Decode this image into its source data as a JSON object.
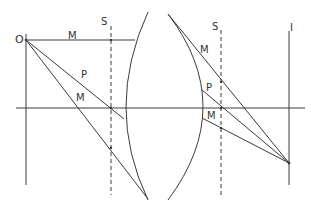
{
  "diagram": {
    "type": "optical ray diagram (thick lens, principal planes)",
    "labels": {
      "object": "O",
      "image": "I",
      "plane_left": "S",
      "plane_right": "S",
      "ray_m_top": "M",
      "ray_p_left": "P",
      "ray_m_left": "M",
      "ray_m_right": "M",
      "ray_p_right": "P",
      "ray_m_right_low": "M"
    },
    "colors": {
      "line": "#3a3a3a",
      "background": "#ffffff"
    }
  }
}
